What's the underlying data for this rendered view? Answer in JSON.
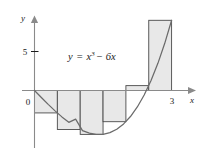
{
  "figure": {
    "name": "riemann-sum-figure",
    "background_color": "#ffffff",
    "curve_color": "#6b6b6b",
    "axis_color": "#8a8a8a",
    "rect_fill_color": "#e8e8e8",
    "rect_stroke_color": "#4a4a4a",
    "text_color": "#1a1a1a"
  },
  "labels": {
    "y_axis": "y",
    "x_axis": "x",
    "origin": "0",
    "y_tick_5": "5",
    "x_tick_3": "3"
  },
  "equation": {
    "lhs": "y",
    "equals": "=",
    "base": "x",
    "exponent": "3",
    "minus": "−",
    "term": "6x",
    "full": "y = x³ − 6x"
  },
  "chart_data": {
    "type": "area",
    "title": "",
    "subtitle": "",
    "annotations": [
      "y = x³ − 6x"
    ],
    "xlabel": "x",
    "ylabel": "y",
    "xlim": [
      -0.25,
      3.55
    ],
    "ylim": [
      -7.2,
      11.0
    ],
    "grid": false,
    "legend": null,
    "xticks": [
      0,
      3
    ],
    "xticklabels": [
      "0",
      "3"
    ],
    "yticks": [
      5
    ],
    "yticklabels": [
      "5"
    ],
    "function": "x^3 - 6x",
    "domain": [
      0,
      3
    ],
    "curve": {
      "x": [
        0,
        0.15,
        0.3,
        0.45,
        0.6,
        0.75,
        0.9,
        1.05,
        1.2,
        1.35,
        1.5,
        1.65,
        1.8,
        1.95,
        2.1,
        2.25,
        2.4,
        2.55,
        2.7,
        2.85,
        3
      ],
      "y": [
        0,
        -0.897,
        -1.773,
        -2.609,
        -3.384,
        -4.078,
        -3.671,
        -5.142,
        -5.472,
        -5.639,
        -5.625,
        -5.408,
        -4.968,
        -4.286,
        -3.339,
        -2.109,
        -0.576,
        1.281,
        3.483,
        6.049,
        9
      ]
    },
    "riemann": {
      "method": "right-endpoint",
      "n": 6,
      "dx": 0.5,
      "partitions": [
        0,
        0.5,
        1.0,
        1.5,
        2.0,
        2.5,
        3.0
      ],
      "rectangles": [
        {
          "x_left": 0.0,
          "x_right": 0.5,
          "height": -2.875
        },
        {
          "x_left": 0.5,
          "x_right": 1.0,
          "height": -5.0
        },
        {
          "x_left": 1.0,
          "x_right": 1.5,
          "height": -5.625
        },
        {
          "x_left": 1.5,
          "x_right": 2.0,
          "height": -4.0
        },
        {
          "x_left": 2.0,
          "x_right": 2.5,
          "height": 0.625
        },
        {
          "x_left": 2.5,
          "x_right": 3.0,
          "height": 9.0
        }
      ]
    }
  }
}
